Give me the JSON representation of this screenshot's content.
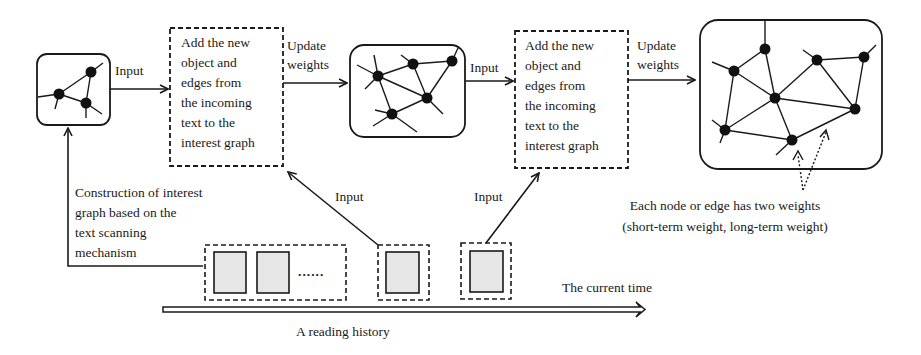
{
  "process_boxes": [
    {
      "lines": [
        "Add the new",
        "object and",
        "edges from",
        "the incoming",
        "text to the",
        "interest graph"
      ]
    },
    {
      "lines": [
        "Add the new",
        "object and",
        "edges from",
        "the incoming",
        "text to the",
        "interest graph"
      ]
    }
  ],
  "arrow_labels": {
    "input_1": "Input",
    "update_1": [
      "Update",
      "weights"
    ],
    "input_2": "Input",
    "update_2": [
      "Update",
      "weights"
    ],
    "input_up_1": "Input",
    "input_up_2": "Input"
  },
  "construction_label": [
    "Construction of interest",
    "graph based on the",
    "text scanning",
    "mechanism"
  ],
  "history": {
    "ellipsis": "......",
    "current_time_label": "The current time",
    "axis_label": "A reading history"
  },
  "weights_note": [
    "Each node or edge has two weights",
    "(short-term weight, long-term weight)"
  ],
  "colors": {
    "stroke": "#1a1a1a",
    "doc_fill": "#e6e6e6",
    "background": "#ffffff"
  }
}
